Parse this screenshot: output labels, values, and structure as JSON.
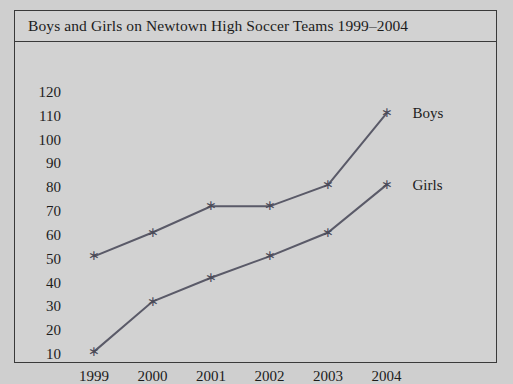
{
  "chart_data": {
    "type": "line",
    "title": "Boys and Girls on Newtown High Soccer Teams 1999–2004",
    "xlabel": "",
    "ylabel": "",
    "categories": [
      "1999",
      "2000",
      "2001",
      "2002",
      "2003",
      "2004"
    ],
    "series": [
      {
        "name": "Boys",
        "values": [
          51,
          61,
          72,
          72,
          81,
          111
        ]
      },
      {
        "name": "Girls",
        "values": [
          11,
          32,
          42,
          51,
          61,
          81
        ]
      }
    ],
    "yticks": [
      10,
      20,
      30,
      40,
      50,
      60,
      70,
      80,
      90,
      100,
      110,
      120
    ],
    "ylim": [
      0,
      125
    ],
    "grid": false,
    "legend_position": "right-inline",
    "marker": "asterisk",
    "line_color": "#5a5a68",
    "text_color": "#1c1c1c",
    "background_color": "#d2d2d2",
    "border_color": "#3a3a3a"
  }
}
